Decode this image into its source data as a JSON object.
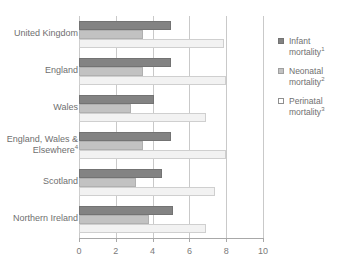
{
  "chart_data": {
    "type": "bar",
    "orientation": "horizontal",
    "title": "",
    "subtitle": "",
    "xlabel": "",
    "ylabel": "",
    "xlim": [
      0,
      10
    ],
    "xticks": [
      0,
      2,
      4,
      6,
      8,
      10
    ],
    "xtick_labels": [
      "0",
      "2",
      "4",
      "6",
      "8",
      "10"
    ],
    "grid": true,
    "grid_axis": "x",
    "legend_position": "right",
    "categories": [
      "United Kingdom",
      "England",
      "Wales",
      "England, Wales &\nElsewhere⁴",
      "Scotland",
      "Northern Ireland"
    ],
    "series": [
      {
        "name": "Infant mortality¹",
        "label_line1": "Infant",
        "label_line2": "mortality",
        "footnote": "1",
        "color": "#838383",
        "values": [
          5.0,
          5.0,
          4.1,
          5.0,
          4.5,
          5.1
        ]
      },
      {
        "name": "Neonatal mortality²",
        "label_line1": "Neonatal",
        "label_line2": "mortality",
        "footnote": "2",
        "color": "#c2c2c2",
        "values": [
          3.5,
          3.5,
          2.8,
          3.5,
          3.1,
          3.8
        ]
      },
      {
        "name": "Perinatal mortality³",
        "label_line1": "Perinatal",
        "label_line2": "mortality",
        "footnote": "3",
        "color": "#f2f2f2",
        "values": [
          7.9,
          8.0,
          6.9,
          8.0,
          7.4,
          6.9
        ]
      }
    ]
  },
  "colors": {
    "infant": "#838383",
    "neonatal": "#c2c2c2",
    "perinatal": "#f2f2f2",
    "grid": "#c9c9c9",
    "axis": "#a8a8a8",
    "text": "#6f6f6f"
  }
}
